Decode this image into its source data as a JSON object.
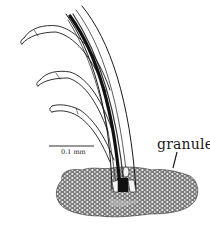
{
  "figure": {
    "labels": {
      "granules": "granules",
      "scale_bar": "0.1 mm"
    },
    "colors": {
      "ink": "#1a1a1a",
      "background": "#ffffff",
      "granule_fill": "#dcdcdc"
    }
  }
}
